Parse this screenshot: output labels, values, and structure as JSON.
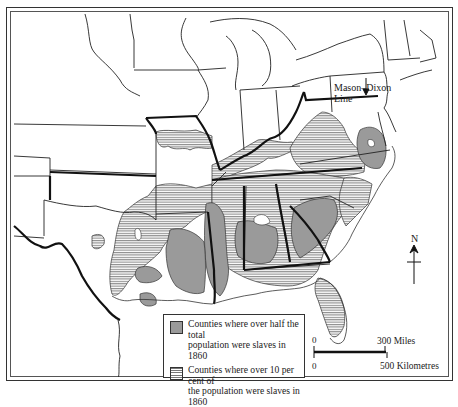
{
  "map": {
    "subject": "Slavery in the Southern United States, 1860",
    "annotation": {
      "line1": "Mason–Dixon",
      "line2": "Line"
    },
    "legend": {
      "items": [
        {
          "symbol": "solid-grey",
          "color": "#9a9a9a",
          "label_line1": "Counties where over half the total",
          "label_line2": "population were slaves in 1860"
        },
        {
          "symbol": "horizontal-hatch",
          "color": "#777777",
          "label_line1": "Counties where over 10 per cent of",
          "label_line2": "the population were slaves in 1860"
        }
      ]
    },
    "scale_bar": {
      "top_zero": "0",
      "top_end": "300 Miles",
      "bottom_zero": "0",
      "bottom_end": "500 Kilometres"
    },
    "north_arrow": {
      "label": "N"
    },
    "colors": {
      "solid_fill": "#9a9a9a",
      "hatch_line": "#777777",
      "border": "#222222",
      "background": "#ffffff"
    }
  }
}
